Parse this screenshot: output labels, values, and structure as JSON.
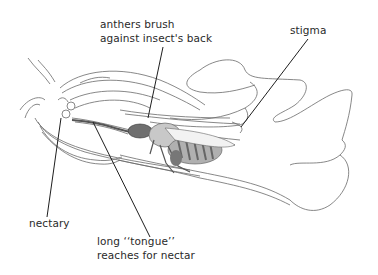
{
  "diagram": {
    "labels": {
      "anthers": {
        "line1": "anthers brush",
        "line2": "against insect's back"
      },
      "stigma": "stigma",
      "nectary": "nectary",
      "tongue": {
        "line1": "long ‘‘tongue’’",
        "line2": "reaches for nectar"
      }
    },
    "colors": {
      "outline": "#6a6a6a",
      "leader": "#1e1e1e",
      "insect_fill": "#b5b5b5",
      "insect_dark": "#6f6f6f",
      "text": "#2a2a2a"
    }
  }
}
